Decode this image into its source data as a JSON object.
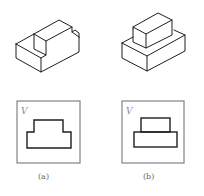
{
  "figures": [
    {
      "id": "a",
      "caption": "(a)",
      "view_label": "V",
      "description": "Isometric L-shaped block with stepped top and rectangular notch; front view shows inverted T profile"
    },
    {
      "id": "b",
      "caption": "(b)",
      "view_label": "V",
      "description": "Isometric stacked boxes (small box on larger box); front view shows two stacked rectangles"
    }
  ],
  "colors": {
    "line": "#1e1e1e",
    "frame": "#6a6a6a",
    "label": "#8a8a8a"
  }
}
